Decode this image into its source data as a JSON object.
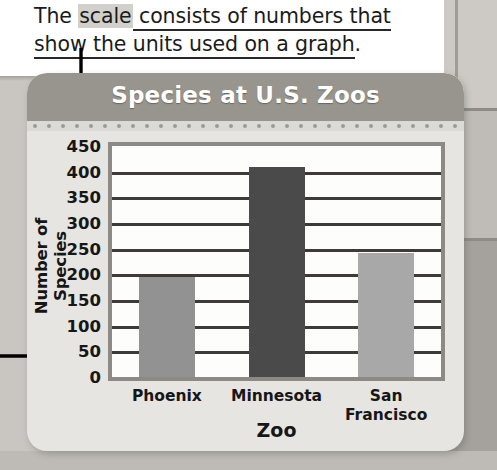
{
  "caption": {
    "line1_prefix": "The ",
    "highlighted_term": "scale",
    "line1_rest": " consists of numbers that",
    "line2": "show the units used on a graph",
    "line2_period": "."
  },
  "card": {
    "title": "Species at U.S. Zoos"
  },
  "annotations": {
    "arrow_down_name": "arrow-pointing-to-scale",
    "arrow_right_name": "arrow-pointing-to-scale-values"
  },
  "chart_data": {
    "type": "bar",
    "title": "Species at U.S. Zoos",
    "xlabel": "Zoo",
    "ylabel": "Number of Species",
    "categories": [
      "Phoenix",
      "Minnesota",
      "San Francisco"
    ],
    "category_lines": [
      [
        "Phoenix"
      ],
      [
        "Minnesota"
      ],
      [
        "San",
        "Francisco"
      ]
    ],
    "values": [
      195,
      410,
      242
    ],
    "ylim": [
      0,
      450
    ],
    "yticks": [
      450,
      400,
      350,
      300,
      250,
      200,
      150,
      100,
      50,
      0
    ],
    "grid": true,
    "legend": "none",
    "bar_colors": [
      "#929292",
      "#4a4a4a",
      "#a8a8a8"
    ]
  },
  "colors": {
    "header_bg": "#98958f",
    "card_bg": "#e7e5e1",
    "plot_bg": "#fdfdfc",
    "plot_border": "#8d8a85",
    "gridline": "#3d3b39",
    "title_text": "#ffffff",
    "body_text": "#161616",
    "page_bg": "#c9c6c2"
  }
}
